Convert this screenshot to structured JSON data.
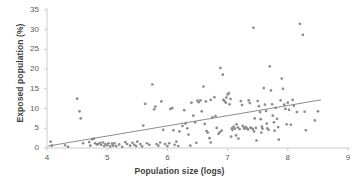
{
  "chart_data": {
    "type": "scatter",
    "title": "",
    "xlabel": "Population size (logs)",
    "ylabel": "Exposed population (%)",
    "xlim": [
      4,
      9
    ],
    "ylim": [
      0,
      35
    ],
    "xticks": [
      4,
      5,
      6,
      7,
      8,
      9
    ],
    "yticks": [
      0,
      5,
      10,
      15,
      20,
      25,
      30,
      35
    ],
    "grid": false,
    "legend": false,
    "marker_color": "#8c8c8c",
    "trendline_color": "#7f7f7f",
    "axis_color": "#bfbfbf",
    "trendline": {
      "x": [
        4.02,
        8.55
      ],
      "y": [
        0.5,
        12.2
      ]
    },
    "points": [
      [
        4.06,
        1.6
      ],
      [
        4.08,
        0.6
      ],
      [
        4.3,
        0.7
      ],
      [
        4.35,
        0.3
      ],
      [
        4.5,
        12.5
      ],
      [
        4.54,
        9.3
      ],
      [
        4.56,
        7.5
      ],
      [
        4.6,
        1.2
      ],
      [
        4.7,
        1.5
      ],
      [
        4.72,
        0.6
      ],
      [
        4.78,
        2.4
      ],
      [
        4.8,
        1.2
      ],
      [
        4.83,
        0.9
      ],
      [
        4.85,
        1.0
      ],
      [
        4.88,
        1.3
      ],
      [
        4.9,
        0.8
      ],
      [
        4.93,
        1.4
      ],
      [
        4.95,
        0.5
      ],
      [
        4.97,
        1.0
      ],
      [
        5.0,
        0.7
      ],
      [
        5.02,
        1.2
      ],
      [
        5.05,
        0.4
      ],
      [
        5.08,
        1.1
      ],
      [
        5.1,
        0.6
      ],
      [
        5.15,
        0.5
      ],
      [
        5.2,
        0.9
      ],
      [
        5.25,
        0.3
      ],
      [
        5.3,
        1.5
      ],
      [
        5.33,
        1.0
      ],
      [
        5.38,
        0.6
      ],
      [
        5.42,
        1.3
      ],
      [
        5.45,
        0.8
      ],
      [
        5.5,
        1.6
      ],
      [
        5.55,
        1.0
      ],
      [
        5.58,
        0.4
      ],
      [
        5.6,
        5.7
      ],
      [
        5.63,
        11.2
      ],
      [
        5.66,
        1.2
      ],
      [
        5.7,
        0.8
      ],
      [
        5.75,
        16.1
      ],
      [
        5.78,
        9.8
      ],
      [
        5.8,
        10.5
      ],
      [
        5.82,
        1.0
      ],
      [
        5.85,
        0.6
      ],
      [
        5.88,
        1.4
      ],
      [
        5.9,
        11.8
      ],
      [
        5.93,
        4.6
      ],
      [
        5.96,
        1.0
      ],
      [
        6.0,
        0.5
      ],
      [
        6.03,
        1.2
      ],
      [
        6.05,
        9.9
      ],
      [
        6.08,
        10.1
      ],
      [
        6.1,
        4.5
      ],
      [
        6.12,
        0.8
      ],
      [
        6.15,
        1.6
      ],
      [
        6.18,
        0.5
      ],
      [
        6.2,
        4.2
      ],
      [
        6.25,
        5.6
      ],
      [
        6.28,
        9.6
      ],
      [
        6.3,
        6.2
      ],
      [
        6.33,
        5.0
      ],
      [
        6.35,
        3.4
      ],
      [
        6.4,
        11.5
      ],
      [
        6.43,
        8.2
      ],
      [
        6.46,
        6.5
      ],
      [
        6.5,
        12.0
      ],
      [
        6.52,
        11.6
      ],
      [
        6.55,
        12.1
      ],
      [
        6.57,
        9.3
      ],
      [
        6.6,
        15.6
      ],
      [
        6.62,
        6.1
      ],
      [
        6.65,
        4.3
      ],
      [
        6.67,
        3.9
      ],
      [
        6.7,
        2.5
      ],
      [
        6.72,
        1.4
      ],
      [
        6.75,
        7.8
      ],
      [
        6.78,
        12.9
      ],
      [
        6.8,
        8.1
      ],
      [
        6.82,
        5.1
      ],
      [
        6.85,
        3.6
      ],
      [
        6.87,
        4.0
      ],
      [
        6.88,
        20.3
      ],
      [
        6.9,
        4.4
      ],
      [
        6.92,
        18.6
      ],
      [
        6.93,
        12.2
      ],
      [
        6.95,
        11.9
      ],
      [
        6.97,
        11.5
      ],
      [
        6.98,
        12.8
      ],
      [
        7.0,
        13.6
      ],
      [
        7.02,
        13.9
      ],
      [
        7.03,
        11.1
      ],
      [
        7.05,
        12.4
      ],
      [
        7.07,
        5.0
      ],
      [
        7.08,
        4.6
      ],
      [
        7.1,
        5.4
      ],
      [
        7.12,
        4.9
      ],
      [
        7.14,
        3.2
      ],
      [
        7.15,
        6.0
      ],
      [
        7.17,
        5.2
      ],
      [
        7.18,
        2.4
      ],
      [
        7.2,
        4.8
      ],
      [
        7.22,
        11.9
      ],
      [
        7.24,
        10.9
      ],
      [
        7.25,
        5.6
      ],
      [
        7.27,
        5.1
      ],
      [
        7.28,
        4.9
      ],
      [
        7.3,
        5.3
      ],
      [
        7.32,
        5.0
      ],
      [
        7.34,
        4.7
      ],
      [
        7.35,
        12.1
      ],
      [
        7.37,
        11.4
      ],
      [
        7.38,
        5.2
      ],
      [
        7.4,
        5.0
      ],
      [
        7.42,
        4.8
      ],
      [
        7.43,
        30.5
      ],
      [
        7.45,
        7.5
      ],
      [
        7.47,
        5.1
      ],
      [
        7.48,
        1.9
      ],
      [
        7.5,
        11.9
      ],
      [
        7.52,
        10.6
      ],
      [
        7.54,
        9.1
      ],
      [
        7.55,
        7.3
      ],
      [
        7.57,
        5.4
      ],
      [
        7.58,
        4.9
      ],
      [
        7.6,
        15.2
      ],
      [
        7.62,
        11.0
      ],
      [
        7.64,
        9.4
      ],
      [
        7.65,
        6.2
      ],
      [
        7.66,
        5.0
      ],
      [
        7.68,
        4.6
      ],
      [
        7.7,
        20.7
      ],
      [
        7.72,
        14.6
      ],
      [
        7.74,
        11.1
      ],
      [
        7.75,
        8.2
      ],
      [
        7.77,
        6.5
      ],
      [
        7.78,
        4.4
      ],
      [
        7.8,
        10.2
      ],
      [
        7.82,
        7.4
      ],
      [
        7.84,
        5.3
      ],
      [
        7.85,
        2.1
      ],
      [
        7.88,
        12.1
      ],
      [
        7.9,
        17.6
      ],
      [
        7.92,
        15.0
      ],
      [
        7.94,
        11.0
      ],
      [
        7.96,
        9.9
      ],
      [
        7.98,
        6.0
      ],
      [
        8.0,
        11.5
      ],
      [
        8.02,
        9.7
      ],
      [
        8.05,
        5.9
      ],
      [
        8.08,
        12.2
      ],
      [
        8.1,
        10.7
      ],
      [
        8.15,
        9.1
      ],
      [
        8.2,
        31.5
      ],
      [
        8.25,
        28.7
      ],
      [
        8.28,
        9.2
      ],
      [
        8.3,
        4.5
      ],
      [
        8.45,
        7.0
      ],
      [
        8.5,
        9.3
      ],
      [
        6.38,
        0.6
      ],
      [
        6.48,
        1.3
      ],
      [
        5.48,
        0.5
      ],
      [
        5.12,
        1.2
      ],
      [
        4.75,
        2.2
      ],
      [
        7.06,
        2.9
      ],
      [
        6.72,
        12.2
      ],
      [
        6.64,
        11.8
      ],
      [
        7.44,
        4.2
      ],
      [
        7.56,
        3.9
      ]
    ]
  },
  "axes": {
    "x_tick_labels": [
      "4",
      "5",
      "6",
      "7",
      "8",
      "9"
    ],
    "y_tick_labels": [
      "0",
      "5",
      "10",
      "15",
      "20",
      "25",
      "30",
      "35"
    ]
  }
}
